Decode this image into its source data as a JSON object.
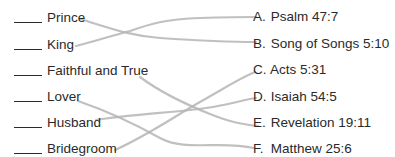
{
  "left_items": [
    {
      "label": "Prince"
    },
    {
      "label": "King"
    },
    {
      "label": "Faithful and True"
    },
    {
      "label": "Lover"
    },
    {
      "label": "Husband"
    },
    {
      "label": "Bridegroom"
    }
  ],
  "right_items": [
    {
      "letter": "A.",
      "reference": "Psalm 47:7"
    },
    {
      "letter": "B.",
      "reference": "Song of Songs 5:10"
    },
    {
      "letter": "C.",
      "reference": "Acts 5:31"
    },
    {
      "letter": "D.",
      "reference": "Isaiah 54:5"
    },
    {
      "letter": "E.",
      "reference": "Revelation 19:11"
    },
    {
      "letter": "F.",
      "reference": "Matthew 25:6"
    }
  ],
  "connections": [
    {
      "from": "Prince",
      "to": "B."
    },
    {
      "from": "King",
      "to": "A."
    },
    {
      "from": "Faithful and True",
      "to": "E."
    },
    {
      "from": "Lover",
      "to": "F."
    },
    {
      "from": "Husband",
      "to": "D."
    },
    {
      "from": "Bridegroom",
      "to": "C."
    }
  ],
  "colors": {
    "text": "#2a2a2a",
    "line": "#b5b5b5"
  }
}
